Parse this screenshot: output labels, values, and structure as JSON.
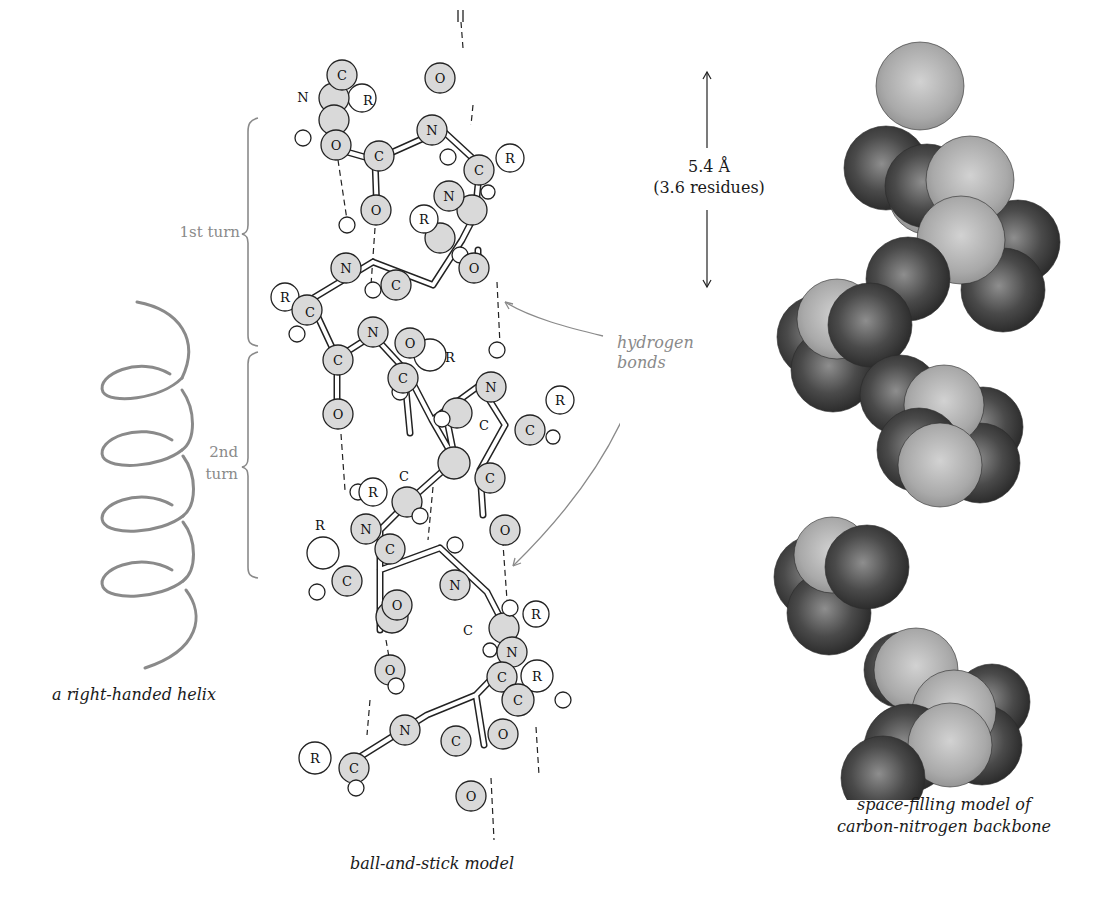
{
  "figure": {
    "helix_caption": "a right-handed helix",
    "ball_stick_caption": "ball-and-stick model",
    "space_fill_caption_line1": "space-filling model of",
    "space_fill_caption_line2": "carbon-nitrogen backbone",
    "first_turn_label": "1st turn",
    "second_turn_line1": "2nd",
    "second_turn_line2": "turn",
    "scale_value": "5.4 Å",
    "scale_residues": "(3.6 residues)",
    "hbond_line1": "hydrogen",
    "hbond_line2": "bonds"
  },
  "atoms": {
    "carbon": "C",
    "nitrogen": "N",
    "oxygen": "O",
    "r_group": "R"
  },
  "colors": {
    "atom_fill": "#d9d9d9",
    "hydrogen_fill": "#ffffff",
    "annotation_gray": "#8a8a8a",
    "sphere_dark": "#3a3a3a",
    "sphere_light": "#b5b5b5"
  }
}
